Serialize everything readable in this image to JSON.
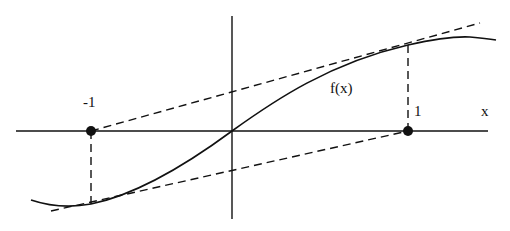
{
  "diagram": {
    "labels": {
      "neg_one": "-1",
      "one": "1",
      "x_axis": "x",
      "function": "f(x)"
    },
    "colors": {
      "stroke": "#111111",
      "background": "#ffffff"
    },
    "geometry": {
      "origin": [
        232,
        131
      ],
      "x_axis": {
        "from": [
          16,
          131
        ],
        "to": [
          488,
          131
        ]
      },
      "y_axis": {
        "from": [
          232,
          16
        ],
        "to": [
          232,
          219
        ]
      },
      "points": [
        {
          "name": "point-neg-one",
          "at": [
            91,
            131
          ]
        },
        {
          "name": "point-one",
          "at": [
            408,
            131
          ]
        }
      ],
      "upper_dashed_line": {
        "from": [
          91,
          131
        ],
        "to": [
          480,
          23
        ]
      },
      "lower_dashed_line": {
        "from": [
          51,
          211
        ],
        "to": [
          408,
          131
        ]
      },
      "vertical_dashed_neg_one": {
        "from": [
          91,
          131
        ],
        "to": [
          91,
          204
        ]
      },
      "vertical_dashed_one": {
        "from": [
          408,
          45
        ],
        "to": [
          408,
          131
        ]
      }
    }
  }
}
